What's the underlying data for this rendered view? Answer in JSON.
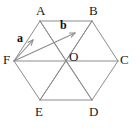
{
  "figure": {
    "type": "geometry-diagram",
    "shape_name": "regular-hexagon",
    "caption": "",
    "colors": {
      "background": "#ffffff",
      "edge_stroke": "#8c8c8c",
      "diagonal_stroke": "#8c8c8c",
      "vector_stroke": "#8c8c8c",
      "label_text": "#1a1a1a",
      "vector_label_text": "#0d0d0d"
    },
    "vertex_labels": [
      {
        "id": "A",
        "text": "A",
        "x": 36,
        "y": 4
      },
      {
        "id": "B",
        "text": "B",
        "x": 89,
        "y": 4
      },
      {
        "id": "C",
        "text": "C",
        "x": 120,
        "y": 53
      },
      {
        "id": "D",
        "text": "D",
        "x": 89,
        "y": 105
      },
      {
        "id": "E",
        "text": "E",
        "x": 35,
        "y": 105
      },
      {
        "id": "F",
        "text": "F",
        "x": 3,
        "y": 53
      },
      {
        "id": "O",
        "text": "O",
        "x": 69,
        "y": 50
      }
    ],
    "vector_labels": [
      {
        "id": "a",
        "text": "a",
        "x": 17,
        "y": 32
      },
      {
        "id": "b",
        "text": "b",
        "x": 60,
        "y": 19
      }
    ],
    "points": {
      "A": {
        "x": 40,
        "y": 21
      },
      "B": {
        "x": 92,
        "y": 21
      },
      "C": {
        "x": 118,
        "y": 61
      },
      "D": {
        "x": 92,
        "y": 100
      },
      "E": {
        "x": 40,
        "y": 100
      },
      "F": {
        "x": 14,
        "y": 61
      },
      "O": {
        "x": 66,
        "y": 61
      }
    },
    "edges": [
      {
        "from": "A",
        "to": "B"
      },
      {
        "from": "B",
        "to": "C"
      },
      {
        "from": "C",
        "to": "D"
      },
      {
        "from": "D",
        "to": "E"
      },
      {
        "from": "E",
        "to": "F"
      },
      {
        "from": "F",
        "to": "A"
      }
    ],
    "diagonals": [
      {
        "from": "F",
        "to": "C"
      },
      {
        "from": "A",
        "to": "O"
      },
      {
        "from": "A",
        "to": "D"
      },
      {
        "from": "B",
        "to": "O"
      },
      {
        "from": "B",
        "to": "E"
      },
      {
        "from": "O",
        "to": "E"
      },
      {
        "from": "O",
        "to": "D"
      }
    ],
    "vectors": [
      {
        "id": "a",
        "label": "a",
        "from": "F",
        "to": "A",
        "tip_x": 33,
        "tip_y": 40
      },
      {
        "id": "b",
        "label": "b",
        "from": "F",
        "to": "B",
        "tip_x": 75,
        "tip_y": 33
      }
    ]
  }
}
